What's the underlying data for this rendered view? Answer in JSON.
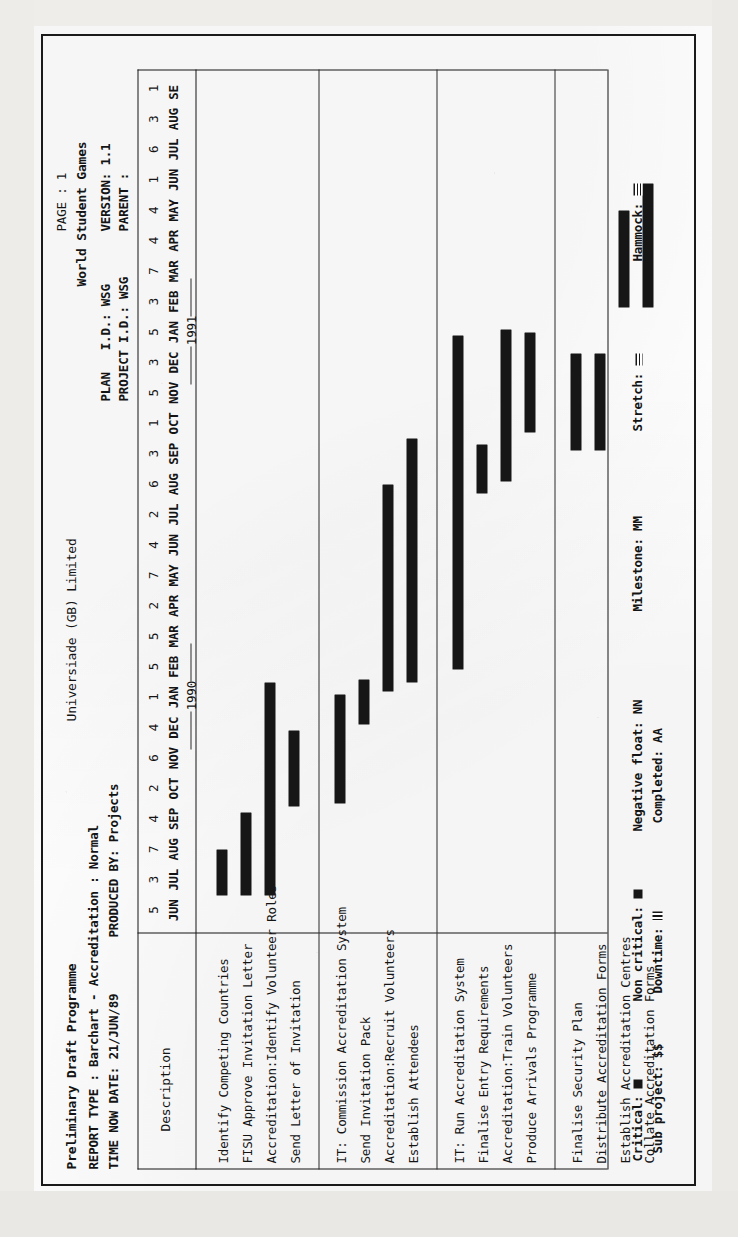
{
  "document": {
    "title": "Preliminary Draft Programme",
    "report_type_line": "REPORT TYPE : Barchart - Accreditation : Normal",
    "time_now_line": "TIME NOW DATE: 21/JUN/89",
    "produced_by_line": "PRODUCED BY: Projects",
    "company": "Universiade (GB) Limited",
    "page_label": "PAGE : 1",
    "project_name": "World Student Games",
    "plan_id_label": "PLAN   I.D.: WSG",
    "project_id_label": "PROJECT I.D.: WSG",
    "version_label": "VERSION: 1.1",
    "parent_label": "PARENT :"
  },
  "columns": {
    "description_header": "Description"
  },
  "chart_data": {
    "type": "bar",
    "chart_kind": "gantt",
    "xlabel": "",
    "ylabel": "",
    "timescale": {
      "week_numbers": [
        "5",
        "3",
        "7",
        "4",
        "2",
        "6",
        "4",
        "1",
        "5",
        "5",
        "2",
        "7",
        "4",
        "2",
        "6",
        "3",
        "1",
        "5",
        "3",
        "5",
        "3",
        "7",
        "4",
        "4",
        "1",
        "6",
        "3",
        "1",
        "5",
        "2"
      ],
      "month_labels": [
        "JUN",
        "JUL",
        "AUG",
        "SEP",
        "OCT",
        "NOV",
        "DEC",
        "JAN",
        "FEB",
        "MAR",
        "APR",
        "MAY",
        "JUN",
        "JUL",
        "AUG",
        "SEP",
        "OCT",
        "NOV",
        "DEC",
        "JAN",
        "FEB",
        "MAR",
        "APR",
        "MAY",
        "JUN",
        "JUL",
        "AUG",
        "SE"
      ],
      "year_markers": [
        {
          "label": "1990",
          "after_month_index": 7
        },
        {
          "label": "1991",
          "after_month_index": 19
        }
      ],
      "start": "JUN 1989",
      "end": "SEP 1991"
    },
    "groups": [
      {
        "tasks": [
          {
            "name": "Identify Competing Countries",
            "start_month": 1.0,
            "duration_months": 1.5,
            "type": "critical"
          },
          {
            "name": "FISU Approve Invitation Letter",
            "start_month": 1.0,
            "duration_months": 2.7,
            "type": "critical"
          },
          {
            "name": "Accreditation:Identify Volunteer Roles",
            "start_month": 1.0,
            "duration_months": 7.0,
            "type": "critical"
          },
          {
            "name": "Send Letter of Invitation",
            "start_month": 3.9,
            "duration_months": 2.5,
            "type": "critical"
          }
        ]
      },
      {
        "tasks": [
          {
            "name": "IT: Commission Accreditation System",
            "start_month": 4.0,
            "duration_months": 3.6,
            "type": "critical"
          },
          {
            "name": "Send Invitation Pack",
            "start_month": 6.6,
            "duration_months": 1.5,
            "type": "critical"
          },
          {
            "name": "Accreditation:Recruit Volunteers",
            "start_month": 7.7,
            "duration_months": 6.8,
            "type": "critical"
          },
          {
            "name": "Establish Attendees",
            "start_month": 8.0,
            "duration_months": 8.0,
            "type": "critical"
          }
        ]
      },
      {
        "tasks": [
          {
            "name": "IT: Run Accreditation System",
            "start_month": 8.4,
            "duration_months": 11.0,
            "type": "critical"
          },
          {
            "name": "Finalise Entry Requirements",
            "start_month": 14.2,
            "duration_months": 1.6,
            "type": "critical"
          },
          {
            "name": "Accreditation:Train Volunteers",
            "start_month": 14.6,
            "duration_months": 5.0,
            "type": "critical"
          },
          {
            "name": "Produce Arrivals Programme",
            "start_month": 16.2,
            "duration_months": 3.3,
            "type": "critical"
          }
        ]
      },
      {
        "tasks": [
          {
            "name": "Finalise Security Plan",
            "start_month": 15.6,
            "duration_months": 3.2,
            "type": "critical"
          },
          {
            "name": "Distribute Accreditation Forms",
            "start_month": 15.6,
            "duration_months": 3.2,
            "type": "critical"
          },
          {
            "name": "Establish Accreditation Centres",
            "start_month": 20.3,
            "duration_months": 3.2,
            "type": "critical"
          },
          {
            "name": "Collate Accreditation Forms",
            "start_month": 20.3,
            "duration_months": 4.1,
            "type": "critical"
          }
        ]
      }
    ]
  },
  "legend": {
    "rows": [
      [
        {
          "label": "Critical:",
          "symbol": "solid"
        },
        {
          "label": "Non critical:",
          "symbol": "solid"
        },
        {
          "label": "Negative float:",
          "symbol": "NN"
        },
        {
          "label": "Milestone:",
          "symbol": "MM"
        },
        {
          "label": "Stretch:",
          "symbol": "stretch"
        },
        {
          "label": "Hammock:",
          "symbol": "hammock"
        }
      ],
      [
        {
          "label": "Sub project:",
          "symbol": "$$"
        },
        {
          "label": "Downtime:",
          "symbol": "downtime"
        },
        {
          "label": "Completed:",
          "symbol": "AA"
        }
      ]
    ]
  },
  "colors": {
    "ink": "#161616",
    "paper": "#ffffff",
    "scan_edge": "#ecebe8"
  }
}
